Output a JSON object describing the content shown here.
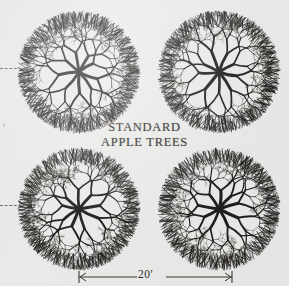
{
  "figure": {
    "kind": "orchard-spacing-diagram",
    "background_color": "#e9e9e7",
    "page_color": "#ffffff",
    "ink_color": "#201e1c",
    "panel": {
      "width": 289,
      "height": 286
    }
  },
  "center_label": {
    "line1": "STANDARD",
    "line2": "APPLE TREES"
  },
  "dimension_bottom": {
    "value": "20'",
    "start_x": 79,
    "end_x": 232,
    "y": 277,
    "tick_half_height": 6,
    "arrow_size": 5
  },
  "dimension_left_marks": [
    {
      "name": "upper-spacing-dash",
      "y": 68,
      "x_start": 0,
      "x_end": 26
    },
    {
      "name": "lower-spacing-dash",
      "y": 205,
      "x_start": 0,
      "x_end": 26
    }
  ],
  "edge_label": {
    "text": "'",
    "x": 3,
    "y": 131
  },
  "trees": [
    {
      "name": "tree-top-left",
      "cx": 79,
      "cy": 72,
      "radius": 59,
      "seed": 11,
      "primary_branches": 9,
      "depth": 6,
      "start_angle": 14
    },
    {
      "name": "tree-top-right",
      "cx": 219,
      "cy": 72,
      "radius": 59,
      "seed": 37,
      "primary_branches": 9,
      "depth": 6,
      "start_angle": 52
    },
    {
      "name": "tree-bottom-left",
      "cx": 79,
      "cy": 209,
      "radius": 59,
      "seed": 64,
      "primary_branches": 9,
      "depth": 6,
      "start_angle": 28
    },
    {
      "name": "tree-bottom-right",
      "cx": 219,
      "cy": 209,
      "radius": 59,
      "seed": 93,
      "primary_branches": 9,
      "depth": 6,
      "start_angle": 70
    }
  ]
}
